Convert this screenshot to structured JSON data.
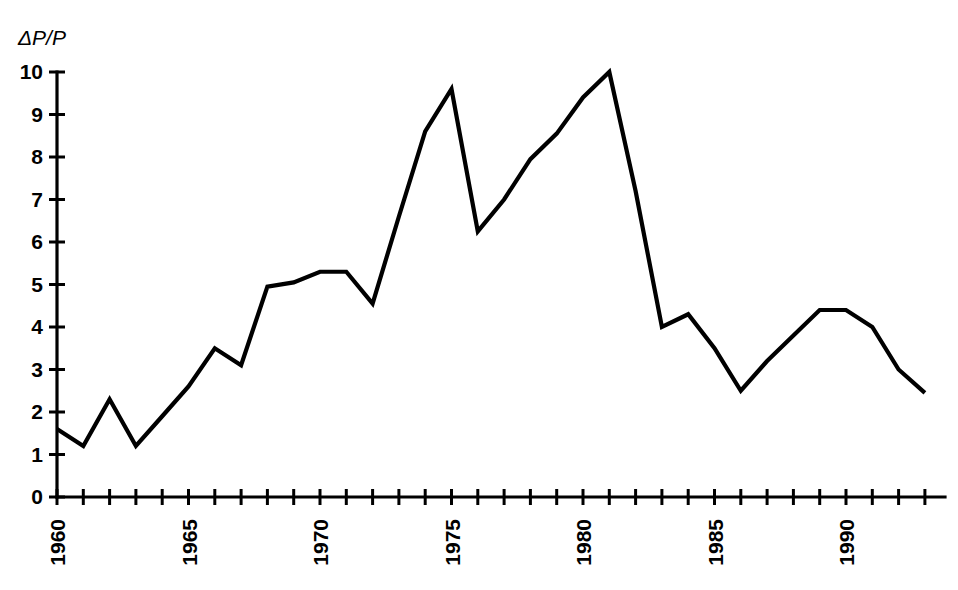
{
  "chart_data": {
    "type": "line",
    "title": "",
    "subtitle": "",
    "xlabel": "",
    "ylabel": "ΔP/P",
    "ylim": [
      0,
      10
    ],
    "xlim": [
      1960,
      1993
    ],
    "grid": false,
    "legend": null,
    "y_ticks": [
      "0",
      "1",
      "2",
      "3",
      "4",
      "5",
      "6",
      "7",
      "8",
      "9",
      "10"
    ],
    "y_tick_values": [
      0,
      1,
      2,
      3,
      4,
      5,
      6,
      7,
      8,
      9,
      10
    ],
    "x_tick_values": [
      1960,
      1961,
      1962,
      1963,
      1964,
      1965,
      1966,
      1967,
      1968,
      1969,
      1970,
      1971,
      1972,
      1973,
      1974,
      1975,
      1976,
      1977,
      1978,
      1979,
      1980,
      1981,
      1982,
      1983,
      1984,
      1985,
      1986,
      1987,
      1988,
      1989,
      1990,
      1991,
      1992,
      1993
    ],
    "x_tick_labels": [
      "1960",
      "",
      "",
      "",
      "",
      "1965",
      "",
      "",
      "",
      "",
      "1970",
      "",
      "",
      "",
      "",
      "1975",
      "",
      "",
      "",
      "",
      "1980",
      "",
      "",
      "",
      "",
      "1985",
      "",
      "",
      "",
      "",
      "1990",
      "",
      "",
      ""
    ],
    "x_labeled_years": [
      1960,
      1965,
      1970,
      1975,
      1980,
      1985,
      1990
    ],
    "series": [
      {
        "name": "ΔP/P",
        "color": "#000000",
        "x": [
          1960,
          1961,
          1962,
          1963,
          1964,
          1965,
          1966,
          1967,
          1968,
          1969,
          1970,
          1971,
          1972,
          1973,
          1974,
          1975,
          1976,
          1977,
          1978,
          1979,
          1980,
          1981,
          1982,
          1983,
          1984,
          1985,
          1986,
          1987,
          1988,
          1989,
          1990,
          1991,
          1992,
          1993
        ],
        "values": [
          1.6,
          1.2,
          2.3,
          1.2,
          1.9,
          2.6,
          3.5,
          3.1,
          4.95,
          5.05,
          5.3,
          5.3,
          4.55,
          6.6,
          8.6,
          9.6,
          6.25,
          7.0,
          7.95,
          8.55,
          9.4,
          10.0,
          7.2,
          4.0,
          4.3,
          3.5,
          2.5,
          3.2,
          3.8,
          4.4,
          4.4,
          4.0,
          3.0,
          2.45
        ]
      }
    ]
  },
  "axis": {
    "y_axis_name": "y-axis",
    "x_axis_name": "x-axis"
  }
}
